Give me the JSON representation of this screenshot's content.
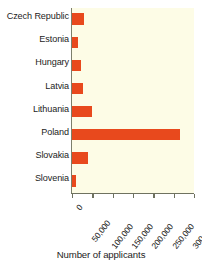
{
  "chart_data": {
    "type": "bar",
    "orientation": "horizontal",
    "title": "",
    "subtitle": "",
    "xlabel": "Number of applicants",
    "ylabel": "",
    "categories": [
      "Czech Republic",
      "Estonia",
      "Hungary",
      "Latvia",
      "Lithuania",
      "Poland",
      "Slovakia",
      "Slovenia"
    ],
    "values": [
      30000,
      15000,
      22000,
      28000,
      50000,
      265000,
      40000,
      10000
    ],
    "series": [
      {
        "name": "Applicants",
        "values": [
          30000,
          15000,
          22000,
          28000,
          50000,
          265000,
          40000,
          10000
        ]
      }
    ],
    "xlim": [
      0,
      300000
    ],
    "xticks": [
      0,
      50000,
      100000,
      150000,
      200000,
      250000,
      300000
    ],
    "xtick_labels": [
      "0",
      "50,000",
      "100,000",
      "150,000",
      "200,000",
      "250,000",
      "300,000"
    ],
    "grid": false,
    "legend": false,
    "legend_position": "none",
    "bar_color": "#e8491d",
    "plot_background": "#fdfce6",
    "axis_color": "#6f7260",
    "figure_background": "#ffffff"
  }
}
